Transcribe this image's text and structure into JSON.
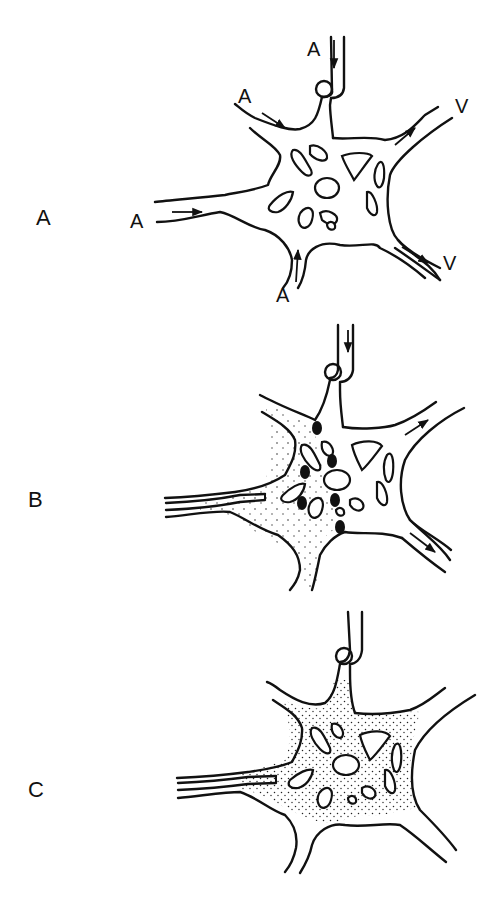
{
  "figure": {
    "panels": [
      {
        "id": "A",
        "label": "A",
        "description": "Vascular network with arterial (A) inflows and venous (V) outflows; arrows indicate flow direction",
        "vessel_labels": [
          "A",
          "A",
          "A",
          "A",
          "V",
          "V"
        ],
        "stippled": false,
        "occlusion_dots": 0,
        "catheter": false
      },
      {
        "id": "B",
        "label": "B",
        "description": "Catheter in left inflow; partial stippled filling of left region with black occlusion dots at boundary; remaining flow arrows",
        "vessel_labels": [],
        "stippled": "partial",
        "occlusion_dots": 6,
        "catheter": true
      },
      {
        "id": "C",
        "label": "C",
        "description": "Catheter in left inflow; whole network stippled (fully filled)",
        "vessel_labels": [],
        "stippled": "full",
        "occlusion_dots": 0,
        "catheter": true
      }
    ],
    "flow_labels": {
      "artery": "A",
      "vein": "V"
    },
    "colors": {
      "ink": "#111111",
      "background": "#ffffff"
    }
  }
}
